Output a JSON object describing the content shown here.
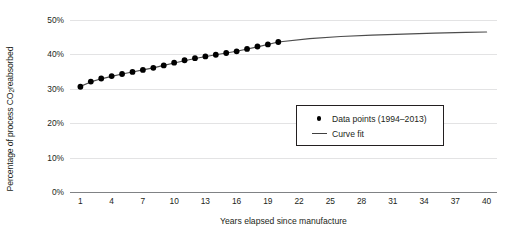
{
  "chart_data": {
    "type": "scatter",
    "title": "",
    "xlabel": "Years elapsed since manufacture",
    "ylabel_parts": {
      "before": "Percentage of process CO",
      "sub": "2",
      "after": " reabsorbed"
    },
    "ylabel": "Percentage of process CO2 reabsorbed",
    "xlim": [
      0,
      41
    ],
    "ylim": [
      0,
      50
    ],
    "xticks": [
      1,
      4,
      7,
      10,
      13,
      16,
      19,
      22,
      25,
      28,
      31,
      34,
      37,
      40
    ],
    "xticklabels": [
      "1",
      "4",
      "7",
      "10",
      "13",
      "16",
      "19",
      "22",
      "25",
      "28",
      "31",
      "34",
      "37",
      "40"
    ],
    "yticks": [
      0,
      10,
      20,
      30,
      40,
      50
    ],
    "yticklabels": [
      "0%",
      "10%",
      "20%",
      "30%",
      "40%",
      "50%"
    ],
    "grid": "horizontal",
    "legend_position": "center",
    "series": [
      {
        "name": "Data points (1994–2013)",
        "type": "scatter",
        "marker": "circle",
        "color": "#000000",
        "x": [
          1,
          2,
          3,
          4,
          5,
          6,
          7,
          8,
          9,
          10,
          11,
          12,
          13,
          14,
          15,
          16,
          17,
          18,
          19,
          20
        ],
        "values": [
          30.6,
          32.1,
          33.0,
          33.7,
          34.3,
          34.9,
          35.5,
          36.1,
          36.8,
          37.6,
          38.3,
          38.9,
          39.4,
          39.9,
          40.4,
          40.9,
          41.6,
          42.3,
          42.9,
          43.6
        ]
      },
      {
        "name": "Curve fit",
        "type": "line",
        "color": "#4d4d4d",
        "x": [
          1,
          2,
          3,
          4,
          5,
          6,
          7,
          8,
          9,
          10,
          12,
          14,
          16,
          18,
          20,
          23,
          26,
          29,
          32,
          35,
          38,
          40
        ],
        "values": [
          30.7,
          32.0,
          32.9,
          33.6,
          34.3,
          34.9,
          35.5,
          36.1,
          36.8,
          37.5,
          38.8,
          39.9,
          40.9,
          42.2,
          43.6,
          44.6,
          45.2,
          45.6,
          45.9,
          46.2,
          46.4,
          46.5
        ]
      }
    ]
  },
  "legend": {
    "items": [
      {
        "key": "dot",
        "label": "Data points (1994–2013)"
      },
      {
        "key": "line",
        "label": "Curve fit"
      }
    ]
  }
}
